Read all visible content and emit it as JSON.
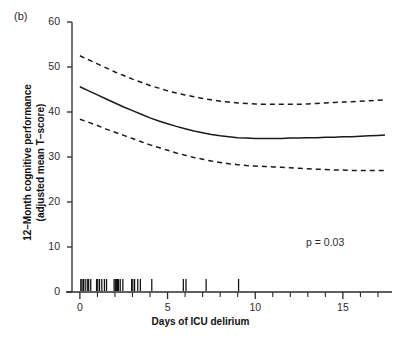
{
  "figure": {
    "panel_label": "(b)",
    "annotation": "p = 0.03"
  },
  "chart_data": {
    "type": "line",
    "title": "",
    "subtitle": "",
    "xlabel": "Days of ICU delirium",
    "ylabel": "12–Month cognitive performance (adjusted mean T–score)",
    "ylabel_line1": "12–Month cognitive performance",
    "ylabel_line2": "(adjusted mean T–score)",
    "xlim": [
      -0.45,
      17.8
    ],
    "ylim": [
      0,
      60
    ],
    "grid": false,
    "legend": null,
    "xticks_major": [
      0,
      5,
      10,
      15
    ],
    "xtick_labels": [
      "0",
      "5",
      "10",
      "15"
    ],
    "xticks_minor": [
      1,
      2,
      3,
      4,
      6,
      7,
      8,
      9,
      11,
      12,
      13,
      14,
      16,
      17
    ],
    "yticks": [
      0,
      10,
      20,
      30,
      40,
      50,
      60
    ],
    "ytick_labels": [
      "0",
      "10",
      "20",
      "30",
      "40",
      "50",
      "60"
    ],
    "annotations": [
      {
        "text": "p = 0.03",
        "x": 13.2,
        "y": 11.5
      }
    ],
    "x": [
      0,
      0.5,
      1,
      1.5,
      2,
      2.5,
      3,
      3.5,
      4,
      4.5,
      5,
      5.5,
      6,
      6.5,
      7,
      7.5,
      8,
      8.5,
      9,
      9.5,
      10,
      10.5,
      11,
      11.5,
      12,
      12.5,
      13,
      13.5,
      14,
      14.5,
      15,
      15.5,
      16,
      16.5,
      17,
      17.4
    ],
    "series": [
      {
        "name": "Upper 95% confidence limit",
        "style": "dashed",
        "values": [
          52.5,
          51.6,
          50.7,
          49.8,
          48.9,
          48.1,
          47.3,
          46.6,
          45.9,
          45.3,
          44.7,
          44.2,
          43.8,
          43.4,
          43.0,
          42.7,
          42.4,
          42.2,
          42.0,
          41.9,
          41.8,
          41.7,
          41.7,
          41.7,
          41.7,
          41.7,
          41.8,
          41.9,
          42.0,
          42.1,
          42.2,
          42.3,
          42.4,
          42.5,
          42.6,
          42.7
        ]
      },
      {
        "name": "Adjusted mean T-score",
        "style": "solid",
        "values": [
          45.6,
          44.7,
          43.8,
          42.9,
          42.0,
          41.1,
          40.3,
          39.5,
          38.7,
          38.0,
          37.4,
          36.8,
          36.3,
          35.8,
          35.4,
          35.0,
          34.7,
          34.5,
          34.3,
          34.2,
          34.1,
          34.1,
          34.1,
          34.1,
          34.2,
          34.2,
          34.3,
          34.3,
          34.4,
          34.4,
          34.5,
          34.5,
          34.6,
          34.7,
          34.8,
          34.9
        ]
      },
      {
        "name": "Lower 95% confidence limit",
        "style": "dashed",
        "values": [
          38.4,
          37.7,
          37.0,
          36.2,
          35.5,
          34.8,
          34.1,
          33.4,
          32.7,
          32.1,
          31.5,
          30.9,
          30.4,
          29.9,
          29.5,
          29.1,
          28.8,
          28.5,
          28.3,
          28.1,
          28.0,
          27.9,
          27.8,
          27.7,
          27.6,
          27.5,
          27.4,
          27.3,
          27.2,
          27.1,
          27.1,
          27.0,
          27.0,
          27.0,
          27.0,
          27.0
        ]
      }
    ],
    "rug": {
      "name": "Observation rug marks at y = 0",
      "values": [
        0.05,
        0.12,
        0.2,
        0.3,
        0.42,
        0.5,
        0.62,
        0.95,
        1.02,
        1.12,
        1.25,
        1.4,
        1.52,
        1.95,
        2.02,
        2.08,
        2.14,
        2.2,
        2.3,
        2.45,
        2.95,
        3.02,
        3.12,
        3.3,
        3.45,
        4.1,
        5.9,
        6.05,
        7.2,
        9.05
      ]
    },
    "colors": {
      "line": "#1a1a1a",
      "axis": "#2b2b2b",
      "background": "#ffffff"
    }
  }
}
